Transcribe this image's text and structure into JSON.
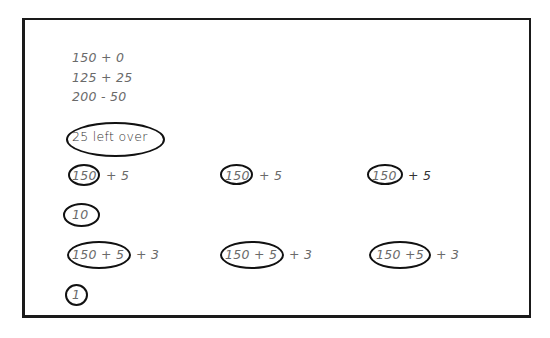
{
  "worksheet": {
    "equations": [
      "150 + 0",
      "125 + 25",
      "200 - 50"
    ],
    "leftover_note": "25 left over",
    "row1": [
      {
        "circled": "150",
        "rest": "+ 5"
      },
      {
        "circled": "150",
        "rest": "+ 5"
      },
      {
        "circled": "150",
        "rest": "+ 5"
      }
    ],
    "answer1": "10",
    "row2": [
      {
        "circled": "150 + 5",
        "rest": "+ 3"
      },
      {
        "circled": "150 + 5",
        "rest": "+ 3"
      },
      {
        "circled": "150 +5",
        "rest": "+ 3"
      }
    ],
    "answer2": "1"
  }
}
